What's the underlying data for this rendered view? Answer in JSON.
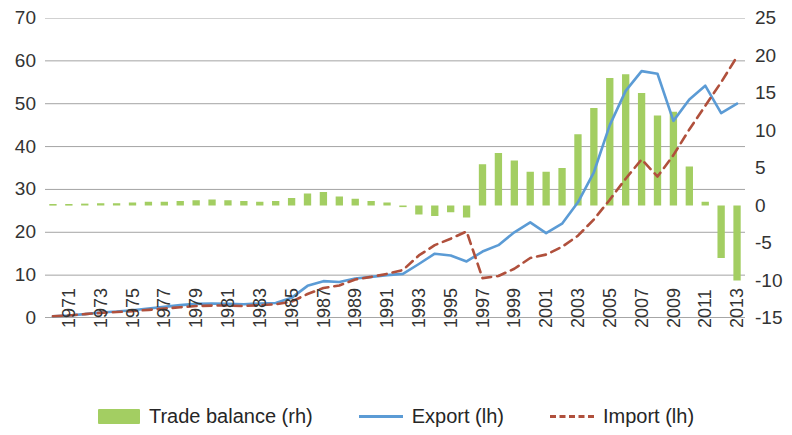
{
  "chart_data": {
    "type": "bar",
    "title": "",
    "subtitle": "",
    "xlabel": "",
    "ylabel": "",
    "grid": true,
    "legend_position": "bottom",
    "x": [
      1971,
      1972,
      1973,
      1974,
      1975,
      1976,
      1977,
      1978,
      1979,
      1980,
      1981,
      1982,
      1983,
      1984,
      1985,
      1986,
      1987,
      1988,
      1989,
      1990,
      1991,
      1992,
      1993,
      1994,
      1995,
      1996,
      1997,
      1998,
      1999,
      2000,
      2001,
      2002,
      2003,
      2004,
      2005,
      2006,
      2007,
      2008,
      2009,
      2010,
      2011,
      2012,
      2013,
      2014
    ],
    "tick_labels": [
      "1971",
      "1973",
      "1975",
      "1977",
      "1979",
      "1981",
      "1983",
      "1985",
      "1987",
      "1989",
      "1991",
      "1993",
      "1995",
      "1997",
      "1999",
      "2001",
      "2003",
      "2005",
      "2007",
      "2009",
      "2011",
      "2013"
    ],
    "left_axis": {
      "label": "",
      "ticks": [
        0,
        10,
        20,
        30,
        40,
        50,
        60,
        70
      ],
      "ylim": [
        0,
        70
      ]
    },
    "right_axis": {
      "label": "",
      "ticks": [
        -15,
        -10,
        -5,
        0,
        5,
        10,
        15,
        20,
        25
      ],
      "ylim": [
        -15,
        25
      ]
    },
    "series": [
      {
        "name": "Trade balance (rh)",
        "type": "bar",
        "axis": "right",
        "color": "#A3CE62",
        "values": [
          0.2,
          0.2,
          0.25,
          0.3,
          0.3,
          0.4,
          0.5,
          0.5,
          0.6,
          0.7,
          0.8,
          0.7,
          0.6,
          0.5,
          0.6,
          1.0,
          1.6,
          1.8,
          1.2,
          0.9,
          0.6,
          0.4,
          -0.1,
          -1.2,
          -1.4,
          -0.9,
          -1.6,
          5.5,
          7.0,
          6.0,
          4.5,
          4.5,
          5.0,
          9.5,
          13.0,
          17.0,
          17.5,
          15.0,
          12.0,
          12.5,
          5.2,
          0.5,
          -7.0,
          -10.0
        ]
      },
      {
        "name": "Export (lh)",
        "type": "line",
        "axis": "left",
        "color": "#5B9BD5",
        "style": "solid",
        "values": [
          0.4,
          0.6,
          0.9,
          1.3,
          1.5,
          1.8,
          2.2,
          2.6,
          3.0,
          3.3,
          3.4,
          3.3,
          3.2,
          3.4,
          3.5,
          4.7,
          7.5,
          8.6,
          8.4,
          9.2,
          9.6,
          10.0,
          10.3,
          12.6,
          15.0,
          14.6,
          13.2,
          15.5,
          17.0,
          20.0,
          22.3,
          19.8,
          22.0,
          27.0,
          34.0,
          45.0,
          53.0,
          57.6,
          57.0,
          46.0,
          51.0,
          54.2,
          47.8,
          50.0
        ]
      },
      {
        "name": "Import (lh)",
        "type": "line",
        "axis": "left",
        "color": "#B0503C",
        "style": "dashed",
        "values": [
          0.4,
          0.6,
          0.9,
          1.2,
          1.4,
          1.6,
          1.9,
          2.2,
          2.5,
          2.8,
          2.9,
          2.9,
          2.8,
          3.0,
          3.2,
          3.8,
          5.6,
          7.0,
          7.6,
          9.0,
          9.6,
          10.3,
          11.2,
          14.6,
          17.0,
          18.5,
          20.2,
          9.3,
          9.8,
          11.5,
          14.0,
          14.8,
          16.6,
          19.2,
          23.0,
          27.6,
          32.5,
          37.0,
          33.0,
          38.0,
          44.0,
          49.5,
          55.0,
          61.0
        ]
      }
    ]
  },
  "legend": {
    "items": [
      {
        "label": "Trade balance (rh)",
        "marker": "bar",
        "color": "#A3CE62"
      },
      {
        "label": "Export (lh)",
        "marker": "line",
        "color": "#5B9BD5"
      },
      {
        "label": "Import (lh)",
        "marker": "dashed-line",
        "color": "#B0503C"
      }
    ]
  }
}
